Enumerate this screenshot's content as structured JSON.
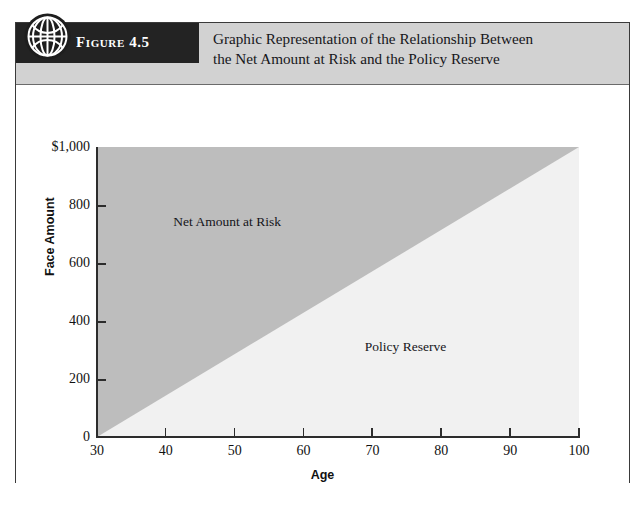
{
  "figure": {
    "tab_label": "Figure 4.5",
    "icon": "globe-icon",
    "title_line_1": "Graphic Representation of the Relationship Between",
    "title_line_2": "the Net Amount at Risk and the Policy Reserve",
    "header_bg": "#d2d2d2",
    "tab_bg": "#232323",
    "frame_border": "#3a3a3a"
  },
  "chart_data": {
    "type": "area",
    "title": "Graphic Representation of the Relationship Between the Net Amount at Risk and the Policy Reserve",
    "xlabel": "Age",
    "ylabel": "Face Amount",
    "xlim": [
      30,
      100
    ],
    "ylim": [
      0,
      1000
    ],
    "xticks": [
      30,
      40,
      50,
      60,
      70,
      80,
      90,
      100
    ],
    "xticklabels": [
      "30",
      "40",
      "50",
      "60",
      "70",
      "80",
      "90",
      "100"
    ],
    "yticks": [
      0,
      200,
      400,
      600,
      800,
      1000
    ],
    "yticklabels": [
      "0",
      "200",
      "400",
      "600",
      "800",
      "$1,000"
    ],
    "grid": false,
    "legend": "none",
    "series": [
      {
        "name": "Policy Reserve",
        "fill_color": "#f1f1f1",
        "x": [
          30,
          100
        ],
        "values": [
          0,
          1000
        ],
        "description": "Linearly increasing reserve from 0 at age 30 to 1,000 at age 100"
      },
      {
        "name": "Net Amount at Risk",
        "fill_color": "#bdbdbd",
        "x": [
          30,
          100
        ],
        "values": [
          1000,
          0
        ],
        "description": "Face amount of 1,000 minus the policy reserve; decreases from 1,000 at age 30 to 0 at age 100"
      }
    ],
    "annotations": [
      {
        "text": "Net Amount at Risk",
        "x": 49,
        "y": 740
      },
      {
        "text": "Policy Reserve",
        "x": 75,
        "y": 310
      }
    ]
  }
}
